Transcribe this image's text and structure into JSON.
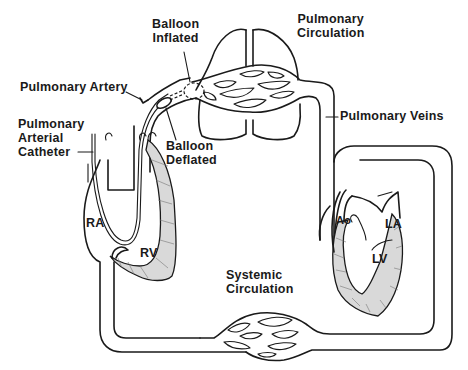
{
  "diagram": {
    "labels": {
      "balloon_inflated": [
        "Balloon",
        "Inflated"
      ],
      "pulmonary_circulation": [
        "Pulmonary",
        "Circulation"
      ],
      "pulmonary_artery": "Pulmonary Artery",
      "pulmonary_arterial_catheter": [
        "Pulmonary",
        "Arterial",
        "Catheter"
      ],
      "balloon_deflated": [
        "Balloon",
        "Deflated"
      ],
      "pulmonary_veins": "Pulmonary Veins",
      "aorta": "Ao",
      "right_atrium": "RA",
      "right_ventricle": "RV",
      "left_atrium": "LA",
      "left_ventricle": "LV",
      "systemic_circulation": [
        "Systemic",
        "Circulation"
      ]
    },
    "colors": {
      "line": "#1a1a1a",
      "background": "#ffffff",
      "myocardium": "#d9d9d9"
    }
  }
}
